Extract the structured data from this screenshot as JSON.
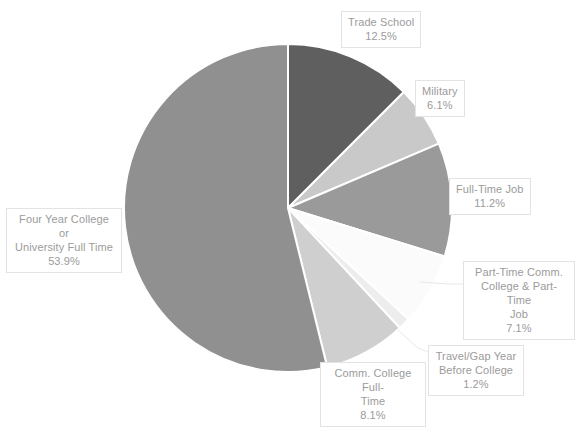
{
  "chart_data": {
    "type": "pie",
    "title": "",
    "xlabel": "",
    "ylabel": "",
    "legend_position": "none",
    "grid": false,
    "start_angle_deg": 0,
    "direction": "clockwise",
    "center": {
      "x": 288,
      "y": 208
    },
    "radius": 164,
    "categories": [
      "Trade School",
      "Military",
      "Full-Time Job",
      "Part-Time Comm. College & Part-Time Job",
      "Travel/Gap Year Before College",
      "Comm. College Full-Time",
      "Four Year College or University Full Time"
    ],
    "values": [
      12.5,
      6.1,
      11.2,
      7.1,
      1.2,
      8.1,
      53.9
    ],
    "value_labels": [
      "12.5%",
      "6.1%",
      "11.2%",
      "7.1%",
      "1.2%",
      "8.1%",
      "53.9%"
    ],
    "colors": [
      "#5f5f5f",
      "#c9c9c9",
      "#9a9a9a",
      "#fbfbfb",
      "#ededed",
      "#cfcfcf",
      "#909090"
    ],
    "slice_border_color": "#ffffff"
  },
  "labels": {
    "trade_school": {
      "name": "Trade School",
      "pct": "12.5%"
    },
    "military": {
      "name": "Military",
      "pct": "6.1%"
    },
    "full_time_job": {
      "name": "Full-Time Job",
      "pct": "11.2%"
    },
    "part_time": {
      "line1": "Part-Time Comm.",
      "line2": "College & Part-Time",
      "line3": "Job",
      "pct": "7.1%"
    },
    "travel_gap": {
      "line1": "Travel/Gap Year",
      "line2": "Before College",
      "pct": "1.2%"
    },
    "comm_college": {
      "line1": "Comm. College Full-",
      "line2": "Time",
      "pct": "8.1%"
    },
    "four_year": {
      "line1": "Four Year College or",
      "line2": "University Full Time",
      "pct": "53.9%"
    }
  }
}
